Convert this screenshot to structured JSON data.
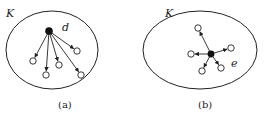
{
  "panels": [
    {
      "set_label": "K",
      "edge_label": "d",
      "caption": "(a)",
      "ellipse": {
        "cx": 52,
        "cy": 50,
        "rx": 46,
        "ry": 39
      },
      "source": {
        "x": 49,
        "y": 31
      },
      "targets": [
        {
          "x": 33,
          "y": 61
        },
        {
          "x": 46,
          "y": 75
        },
        {
          "x": 59,
          "y": 65
        },
        {
          "x": 77,
          "y": 51
        },
        {
          "x": 81,
          "y": 75
        }
      ]
    },
    {
      "set_label": "K",
      "edge_label": "e",
      "caption": "(b)",
      "ellipse": {
        "cx": 200,
        "cy": 50,
        "rx": 57,
        "ry": 39
      },
      "source": {
        "x": 211,
        "y": 54
      },
      "targets": [
        {
          "x": 198,
          "y": 28
        },
        {
          "x": 191,
          "y": 54
        },
        {
          "x": 231,
          "y": 48
        },
        {
          "x": 202,
          "y": 71
        },
        {
          "x": 221,
          "y": 68
        }
      ]
    }
  ],
  "colors": {
    "stroke": "#222222",
    "fill_source": "#111111",
    "fill_target": "#ffffff"
  }
}
